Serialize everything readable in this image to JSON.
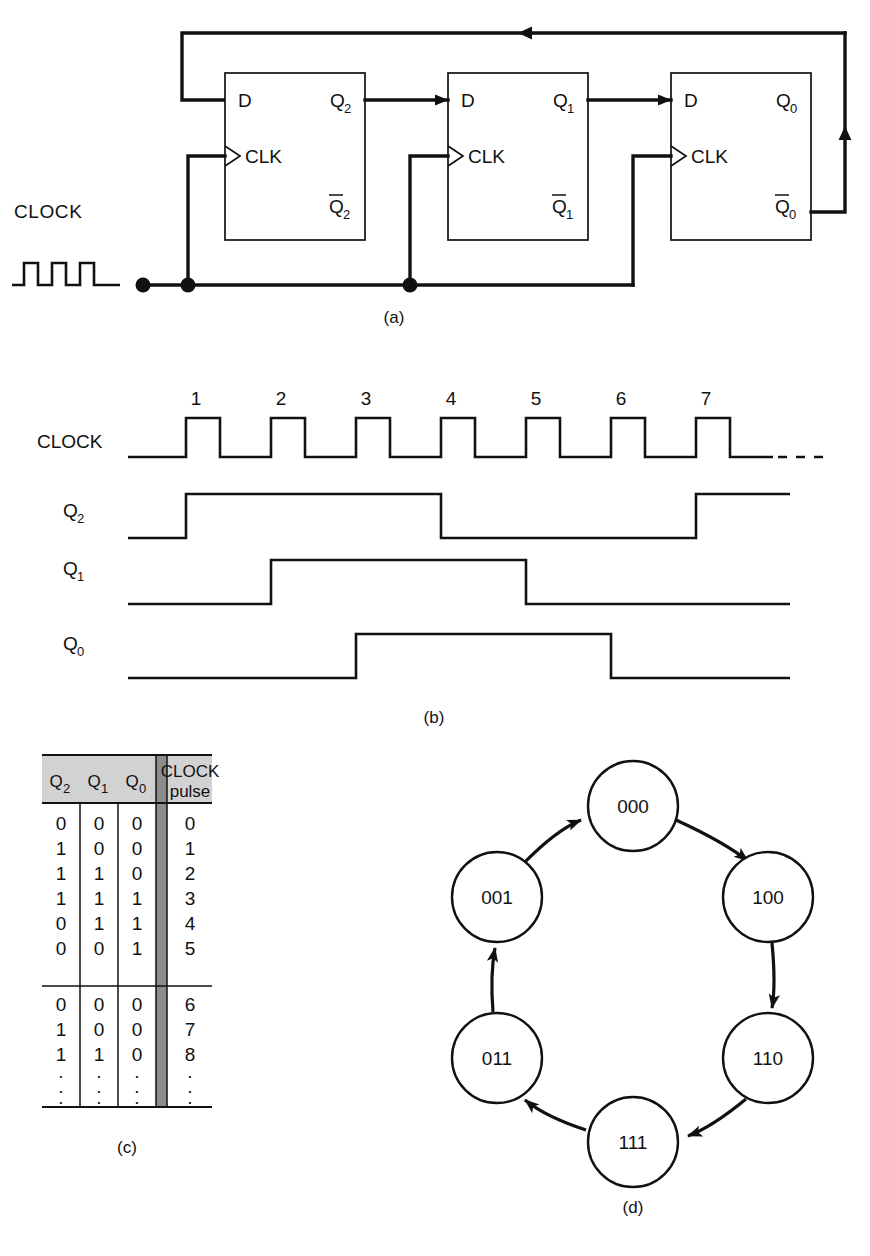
{
  "figure": {
    "captions": {
      "a": "(a)",
      "b": "(b)",
      "c": "(c)",
      "d": "(d)"
    }
  },
  "circuit": {
    "clock_label": "CLOCK",
    "flipflops": [
      {
        "d_label": "D",
        "clk_label": "CLK",
        "q_label": "Q",
        "q_sub": "2",
        "qbar_label": "Q",
        "qbar_sub": "2"
      },
      {
        "d_label": "D",
        "clk_label": "CLK",
        "q_label": "Q",
        "q_sub": "1",
        "qbar_label": "Q",
        "qbar_sub": "1"
      },
      {
        "d_label": "D",
        "clk_label": "CLK",
        "q_label": "Q",
        "q_sub": "0",
        "qbar_label": "Q",
        "qbar_sub": "0"
      }
    ]
  },
  "timing": {
    "row_labels": [
      {
        "text": "CLOCK",
        "sub": ""
      },
      {
        "text": "Q",
        "sub": "2"
      },
      {
        "text": "Q",
        "sub": "1"
      },
      {
        "text": "Q",
        "sub": "0"
      }
    ],
    "pulse_numbers": [
      "1",
      "2",
      "3",
      "4",
      "5",
      "6",
      "7"
    ],
    "continuation": "- - - -",
    "waveforms": {
      "clock": {
        "pulses": 7,
        "rises_at": [
          1,
          2,
          3,
          4,
          5,
          6,
          7
        ]
      },
      "q2": {
        "transitions": [
          {
            "pulse": 1,
            "to": 1
          },
          {
            "pulse": 4,
            "to": 0
          },
          {
            "pulse": 7,
            "to": 1
          }
        ]
      },
      "q1": {
        "transitions": [
          {
            "pulse": 2,
            "to": 1
          },
          {
            "pulse": 5,
            "to": 0
          }
        ]
      },
      "q0": {
        "transitions": [
          {
            "pulse": 3,
            "to": 1
          },
          {
            "pulse": 6,
            "to": 0
          }
        ]
      }
    }
  },
  "table": {
    "headers": [
      {
        "text": "Q",
        "sub": "2"
      },
      {
        "text": "Q",
        "sub": "1"
      },
      {
        "text": "Q",
        "sub": "0"
      },
      {
        "text": "CLOCK",
        "text2": "pulse"
      }
    ],
    "header_bg": "#d2d2d2",
    "separator_bg": "#8c8c8c",
    "group1": [
      {
        "q2": "0",
        "q1": "0",
        "q0": "0",
        "pulse": "0"
      },
      {
        "q2": "1",
        "q1": "0",
        "q0": "0",
        "pulse": "1"
      },
      {
        "q2": "1",
        "q1": "1",
        "q0": "0",
        "pulse": "2"
      },
      {
        "q2": "1",
        "q1": "1",
        "q0": "1",
        "pulse": "3"
      },
      {
        "q2": "0",
        "q1": "1",
        "q0": "1",
        "pulse": "4"
      },
      {
        "q2": "0",
        "q1": "0",
        "q0": "1",
        "pulse": "5"
      }
    ],
    "group2": [
      {
        "q2": "0",
        "q1": "0",
        "q0": "0",
        "pulse": "6"
      },
      {
        "q2": "1",
        "q1": "0",
        "q0": "0",
        "pulse": "7"
      },
      {
        "q2": "1",
        "q1": "1",
        "q0": "0",
        "pulse": "8"
      }
    ],
    "ellipsis_rows": [
      {
        "q2": ".",
        "q1": ".",
        "q0": ".",
        "pulse": "."
      },
      {
        "q2": ".",
        "q1": ".",
        "q0": ".",
        "pulse": "."
      },
      {
        "q2": ".",
        "q1": ".",
        "q0": ".",
        "pulse": "."
      }
    ]
  },
  "state_diagram": {
    "states": [
      {
        "id": "s000",
        "label": "000",
        "cx": 633,
        "cy": 806
      },
      {
        "id": "s100",
        "label": "100",
        "cx": 768,
        "cy": 897
      },
      {
        "id": "s110",
        "label": "110",
        "cx": 768,
        "cy": 1058
      },
      {
        "id": "s111",
        "label": "111",
        "cx": 633,
        "cy": 1142
      },
      {
        "id": "s011",
        "label": "011",
        "cx": 497,
        "cy": 1058
      },
      {
        "id": "s001",
        "label": "001",
        "cx": 497,
        "cy": 897
      }
    ],
    "transitions": [
      {
        "from": "000",
        "to": "100"
      },
      {
        "from": "100",
        "to": "110"
      },
      {
        "from": "110",
        "to": "111"
      },
      {
        "from": "111",
        "to": "011"
      },
      {
        "from": "011",
        "to": "001"
      },
      {
        "from": "001",
        "to": "000"
      }
    ],
    "radius": 45
  }
}
